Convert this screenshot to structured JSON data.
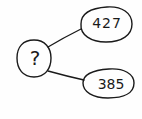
{
  "diagram": {
    "type": "number-bond",
    "whole": {
      "label": "?"
    },
    "parts": [
      {
        "label": "427"
      },
      {
        "label": "385"
      }
    ],
    "colors": {
      "stroke": "#1a1a1a",
      "background": "#fefefe"
    }
  }
}
